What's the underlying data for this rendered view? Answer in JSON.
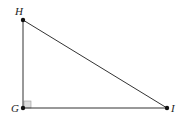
{
  "figure": {
    "type": "right-triangle",
    "vertices": [
      {
        "id": "H",
        "label": "H",
        "x": 23,
        "y": 20,
        "label_x": 15,
        "label_y": 15
      },
      {
        "id": "G",
        "label": "G",
        "x": 23,
        "y": 108,
        "label_x": 11,
        "label_y": 112
      },
      {
        "id": "I",
        "label": "I",
        "x": 167,
        "y": 108,
        "label_x": 171,
        "label_y": 112
      }
    ],
    "right_angle_at": "G",
    "colors": {
      "line": "#333333",
      "point": "#111111",
      "right_angle_fill": "#d9d9d9",
      "right_angle_stroke": "#999999"
    }
  }
}
